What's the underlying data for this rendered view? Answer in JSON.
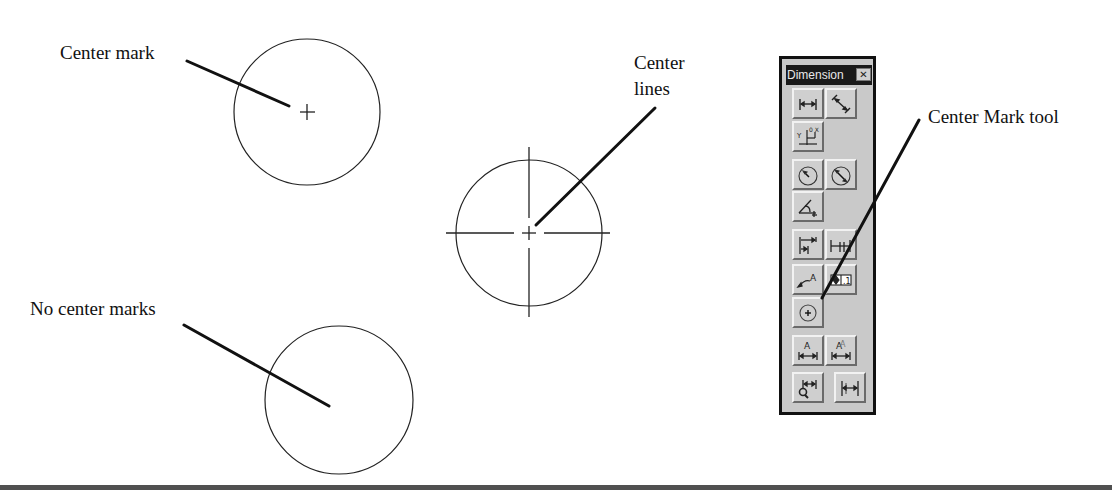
{
  "annotations": {
    "center_mark": "Center mark",
    "center_lines_line1": "Center",
    "center_lines_line2": "lines",
    "no_center_marks": "No center marks",
    "center_mark_tool": "Center Mark tool"
  },
  "figure": {
    "circles": [
      {
        "name": "circle-with-center-mark",
        "cx": 307,
        "cy": 112,
        "r": 73,
        "style": "center mark"
      },
      {
        "name": "circle-with-center-lines",
        "cx": 529,
        "cy": 233,
        "r": 73,
        "style": "center lines"
      },
      {
        "name": "circle-no-center-marks",
        "cx": 339,
        "cy": 400,
        "r": 74,
        "style": "none"
      }
    ],
    "line_color": "#222222",
    "leader_color": "#111111"
  },
  "toolbar": {
    "title": "Dimension",
    "close_glyph": "✕",
    "background": "#c9c9c9",
    "buttons": [
      {
        "name": "linear-dimension-button",
        "icon": "linear-dimension-icon"
      },
      {
        "name": "aligned-dimension-button",
        "icon": "aligned-dimension-icon"
      },
      {
        "name": "ordinate-dimension-button",
        "icon": "ordinate-dimension-icon"
      },
      {
        "name": "radius-dimension-button",
        "icon": "radius-dimension-icon"
      },
      {
        "name": "diameter-dimension-button",
        "icon": "diameter-dimension-icon"
      },
      {
        "name": "angular-dimension-button",
        "icon": "angular-dimension-icon"
      },
      {
        "name": "baseline-dimension-button",
        "icon": "baseline-dimension-icon"
      },
      {
        "name": "continue-dimension-button",
        "icon": "continue-dimension-icon"
      },
      {
        "name": "quick-leader-button",
        "icon": "leader-icon"
      },
      {
        "name": "tolerance-button",
        "icon": "tolerance-icon"
      },
      {
        "name": "center-mark-button",
        "icon": "center-mark-icon"
      },
      {
        "name": "dimension-edit-button",
        "icon": "dimension-edit-icon"
      },
      {
        "name": "dimension-text-edit-button",
        "icon": "dimension-text-edit-icon"
      },
      {
        "name": "dimension-style-button",
        "icon": "dimension-style-icon"
      },
      {
        "name": "dimension-update-button",
        "icon": "dimension-update-icon"
      }
    ]
  }
}
